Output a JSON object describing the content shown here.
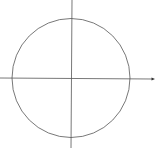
{
  "diagram": {
    "type": "unit-circle-axes",
    "background": "#ffffff",
    "stroke_color": "#555555",
    "circle": {
      "cx": 71,
      "cy": 78,
      "rx": 59,
      "ry": 59.5
    },
    "x_axis": {
      "x1": 0,
      "y1": 78,
      "x2": 153,
      "y2": 79,
      "arrow": true
    },
    "y_axis": {
      "x1": 72,
      "y1": 0,
      "x2": 71,
      "y2": 148,
      "arrow": false
    },
    "labels": []
  }
}
